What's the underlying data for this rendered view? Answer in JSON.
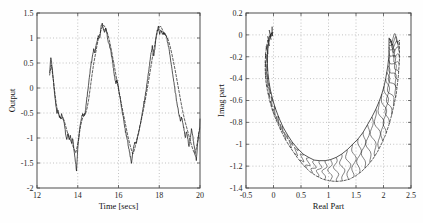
{
  "figure": {
    "background": "#fefefe",
    "width": 423,
    "height": 223,
    "panel_count": 2
  },
  "chart_data": [
    {
      "type": "line",
      "id": "output-time-series",
      "title": "",
      "xlabel": "Time [secs]",
      "ylabel": "Output",
      "xlim": [
        12,
        20
      ],
      "ylim": [
        -2,
        1.5
      ],
      "xticks": [
        12,
        14,
        16,
        18,
        20
      ],
      "xtick_labels": [
        "12",
        "14",
        "16",
        "18",
        "20"
      ],
      "yticks": [
        1.5,
        1,
        0.5,
        0,
        -0.5,
        -1,
        -1.5,
        -2
      ],
      "ytick_labels": [
        "1.5",
        "1",
        "0.5",
        "0",
        "-0.5",
        "-1",
        "-1.5",
        "-2"
      ],
      "grid": true,
      "legend": null,
      "series": [
        {
          "name": "measured-output",
          "style": "solid",
          "color": "#1c1c1c",
          "x": [
            12.62,
            12.68,
            12.74,
            12.8,
            12.86,
            12.92,
            12.98,
            13.04,
            13.1,
            13.16,
            13.22,
            13.28,
            13.34,
            13.4,
            13.46,
            13.52,
            13.58,
            13.64,
            13.7,
            13.76,
            13.82,
            13.88,
            13.94,
            14.0,
            14.06,
            14.12,
            14.18,
            14.24,
            14.3,
            14.36,
            14.42,
            14.48,
            14.54,
            14.6,
            14.66,
            14.72,
            14.78,
            14.84,
            14.9,
            14.96,
            15.02,
            15.08,
            15.14,
            15.2,
            15.26,
            15.32,
            15.38,
            15.44,
            15.5,
            15.56,
            15.62,
            15.68,
            15.74,
            15.8,
            15.86,
            15.92,
            15.98,
            16.04,
            16.1,
            16.16,
            16.22,
            16.28,
            16.34,
            16.4,
            16.46,
            16.52,
            16.58,
            16.64,
            16.7,
            16.76,
            16.82,
            16.88,
            16.94,
            17.0,
            17.06,
            17.12,
            17.18,
            17.24,
            17.3,
            17.36,
            17.42,
            17.48,
            17.54,
            17.6,
            17.66,
            17.72,
            17.78,
            17.84,
            17.9,
            17.96,
            18.02,
            18.08,
            18.14,
            18.2,
            18.26,
            18.32,
            18.38,
            18.44,
            18.5,
            18.56,
            18.62,
            18.68,
            18.74,
            18.8,
            18.86,
            18.92,
            18.98,
            19.04,
            19.1,
            19.16,
            19.22,
            19.28,
            19.34,
            19.4,
            19.46,
            19.52,
            19.58,
            19.64,
            19.7,
            19.76,
            19.82,
            19.88,
            19.94,
            20.0
          ],
          "y": [
            0.3,
            0.62,
            0.44,
            0.16,
            -0.1,
            -0.34,
            -0.5,
            -0.45,
            -0.57,
            -0.6,
            -0.52,
            -0.62,
            -0.72,
            -0.9,
            -1.02,
            -0.9,
            -1.05,
            -0.95,
            -1.1,
            -1.02,
            -1.26,
            -1.45,
            -1.66,
            -1.2,
            -0.95,
            -0.74,
            -0.6,
            -0.52,
            -0.54,
            -0.5,
            -0.3,
            -0.1,
            0.12,
            0.32,
            0.5,
            0.62,
            0.78,
            0.7,
            0.86,
            0.95,
            1.05,
            0.98,
            1.22,
            1.29,
            1.18,
            1.12,
            1.2,
            1.05,
            0.92,
            0.86,
            0.74,
            0.6,
            0.42,
            0.26,
            0.1,
            0.14,
            0.05,
            -0.1,
            -0.26,
            -0.42,
            -0.56,
            -0.7,
            -0.86,
            -0.98,
            -1.1,
            -1.24,
            -1.36,
            -1.48,
            -1.3,
            -1.14,
            -1.06,
            -1.1,
            -0.98,
            -0.86,
            -0.74,
            -0.6,
            -0.46,
            -0.32,
            -0.18,
            -0.02,
            0.16,
            0.34,
            0.52,
            0.7,
            0.84,
            0.62,
            0.78,
            1.0,
            1.15,
            1.22,
            1.06,
            1.16,
            1.1,
            1.08,
            1.09,
            1.06,
            0.98,
            0.86,
            0.72,
            0.56,
            0.4,
            0.24,
            0.06,
            -0.12,
            -0.28,
            -0.42,
            -0.54,
            -0.66,
            -0.58,
            -0.7,
            -0.84,
            -1.0,
            -0.86,
            -1.02,
            -1.16,
            -1.0,
            -0.84,
            -0.96,
            -1.12,
            -1.3,
            -1.46,
            -1.12,
            -0.92,
            -0.8,
            -0.7,
            -0.62
          ]
        },
        {
          "name": "model-output",
          "style": "dashed",
          "color": "#1c1c1c",
          "x": [
            12.62,
            12.7,
            12.78,
            12.86,
            12.94,
            13.02,
            13.1,
            13.18,
            13.26,
            13.34,
            13.42,
            13.5,
            13.58,
            13.66,
            13.74,
            13.82,
            13.9,
            13.98,
            14.06,
            14.14,
            14.22,
            14.3,
            14.38,
            14.46,
            14.54,
            14.62,
            14.7,
            14.78,
            14.86,
            14.94,
            15.02,
            15.1,
            15.18,
            15.26,
            15.34,
            15.42,
            15.5,
            15.58,
            15.66,
            15.74,
            15.82,
            15.9,
            15.98,
            16.06,
            16.14,
            16.22,
            16.3,
            16.38,
            16.46,
            16.54,
            16.62,
            16.7,
            16.78,
            16.86,
            16.94,
            17.02,
            17.1,
            17.18,
            17.26,
            17.34,
            17.42,
            17.5,
            17.58,
            17.66,
            17.74,
            17.82,
            17.9,
            17.98,
            18.06,
            18.14,
            18.22,
            18.3,
            18.38,
            18.46,
            18.54,
            18.62,
            18.7,
            18.78,
            18.86,
            18.94,
            19.02,
            19.1,
            19.18,
            19.26,
            19.34,
            19.42,
            19.5,
            19.58,
            19.66,
            19.74,
            19.82,
            19.9,
            19.98
          ],
          "y": [
            0.26,
            0.46,
            0.24,
            -0.04,
            -0.3,
            -0.48,
            -0.56,
            -0.62,
            -0.58,
            -0.66,
            -0.78,
            -0.9,
            -1.0,
            -1.06,
            -1.14,
            -1.22,
            -1.3,
            -1.16,
            -0.96,
            -0.76,
            -0.62,
            -0.56,
            -0.52,
            -0.4,
            -0.22,
            0.02,
            0.26,
            0.48,
            0.66,
            0.84,
            1.0,
            1.1,
            1.2,
            1.26,
            1.22,
            1.14,
            1.04,
            0.9,
            0.74,
            0.56,
            0.38,
            0.2,
            0.02,
            -0.14,
            -0.32,
            -0.48,
            -0.64,
            -0.8,
            -0.96,
            -1.1,
            -1.22,
            -1.32,
            -1.24,
            -1.1,
            -0.96,
            -0.82,
            -0.68,
            -0.52,
            -0.36,
            -0.18,
            0.0,
            0.2,
            0.4,
            0.6,
            0.78,
            0.96,
            1.1,
            1.2,
            1.24,
            1.18,
            1.1,
            1.06,
            1.02,
            0.94,
            0.82,
            0.68,
            0.52,
            0.36,
            0.18,
            0.0,
            -0.18,
            -0.36,
            -0.52,
            -0.66,
            -0.78,
            -0.9,
            -1.02,
            -1.14,
            -1.24,
            -1.32,
            -1.2,
            -1.02,
            -0.8
          ]
        }
      ]
    },
    {
      "type": "line",
      "id": "nyquist-plot",
      "title": "",
      "xlabel": "Real Part",
      "ylabel": "Imag part",
      "xlim": [
        -0.5,
        2.5
      ],
      "ylim": [
        -1.4,
        0.2
      ],
      "xticks": [
        -0.5,
        0,
        0.5,
        1,
        1.5,
        2,
        2.5
      ],
      "xtick_labels": [
        "-0.5",
        "0",
        "0.5",
        "1",
        "1.5",
        "2",
        "2.5"
      ],
      "yticks": [
        0.2,
        0,
        -0.2,
        -0.4,
        -0.6,
        -0.8,
        -1,
        -1.2,
        -1.4
      ],
      "ytick_labels": [
        "0.2",
        "0",
        "-0.2",
        "-0.4",
        "-0.6",
        "-0.8",
        "-1",
        "-1.2",
        "-1.4"
      ],
      "grid": true,
      "legend": null,
      "series": [
        {
          "name": "nominal-frequency-response",
          "style": "solid",
          "color": "#1c1c1c",
          "real": [
            -0.02,
            -0.05,
            -0.08,
            -0.1,
            -0.11,
            -0.11,
            -0.1,
            -0.08,
            -0.05,
            -0.01,
            0.04,
            0.1,
            0.17,
            0.25,
            0.34,
            0.44,
            0.54,
            0.64,
            0.74,
            0.84,
            0.94,
            1.04,
            1.14,
            1.24,
            1.34,
            1.44,
            1.54,
            1.63,
            1.71,
            1.79,
            1.86,
            1.92,
            1.97,
            2.01,
            2.04,
            2.06,
            2.08,
            2.09,
            2.1,
            2.1,
            2.1,
            2.1,
            2.1,
            2.1,
            2.1,
            2.1
          ],
          "imag": [
            0.02,
            0.0,
            -0.05,
            -0.12,
            -0.2,
            -0.28,
            -0.36,
            -0.44,
            -0.52,
            -0.6,
            -0.68,
            -0.76,
            -0.84,
            -0.91,
            -0.98,
            -1.04,
            -1.09,
            -1.12,
            -1.145,
            -1.15,
            -1.15,
            -1.14,
            -1.12,
            -1.09,
            -1.05,
            -1.0,
            -0.95,
            -0.89,
            -0.82,
            -0.75,
            -0.68,
            -0.61,
            -0.54,
            -0.47,
            -0.4,
            -0.34,
            -0.28,
            -0.23,
            -0.18,
            -0.14,
            -0.11,
            -0.09,
            -0.07,
            -0.05,
            -0.04,
            -0.03
          ]
        },
        {
          "name": "perturbed-frequency-response",
          "style": "dashed",
          "color": "#1c1c1c",
          "real": [
            -0.03,
            -0.07,
            -0.11,
            -0.14,
            -0.15,
            -0.15,
            -0.14,
            -0.11,
            -0.07,
            -0.02,
            0.05,
            0.13,
            0.22,
            0.32,
            0.43,
            0.54,
            0.66,
            0.78,
            0.9,
            1.02,
            1.14,
            1.26,
            1.38,
            1.49,
            1.6,
            1.7,
            1.8,
            1.89,
            1.97,
            2.04,
            2.1,
            2.15,
            2.19,
            2.23,
            2.25,
            2.27,
            2.28,
            2.29,
            2.29,
            2.29,
            2.29,
            2.29
          ],
          "imag": [
            0.02,
            -0.01,
            -0.07,
            -0.15,
            -0.24,
            -0.33,
            -0.42,
            -0.51,
            -0.6,
            -0.69,
            -0.78,
            -0.87,
            -0.96,
            -1.04,
            -1.12,
            -1.19,
            -1.25,
            -1.29,
            -1.32,
            -1.335,
            -1.34,
            -1.335,
            -1.32,
            -1.29,
            -1.25,
            -1.2,
            -1.14,
            -1.07,
            -0.99,
            -0.91,
            -0.82,
            -0.73,
            -0.64,
            -0.55,
            -0.46,
            -0.38,
            -0.3,
            -0.23,
            -0.17,
            -0.12,
            -0.08,
            -0.05
          ]
        },
        {
          "name": "uncertainty-hair-bundle",
          "style": "hair",
          "color": "#1c1c1c",
          "description": "dense oscillatory hairs spanning between nominal and perturbed loci",
          "hair_count": 46,
          "hair_amplitude": 0.055,
          "hair_wiggles": 3
        }
      ]
    }
  ]
}
